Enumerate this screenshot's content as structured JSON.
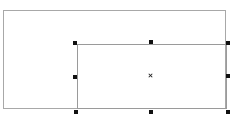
{
  "canvas": {
    "background": "#ffffff"
  },
  "shapes": [
    {
      "id": "outer-rectangle",
      "type": "rectangle",
      "x": 3,
      "y": 10,
      "width": 223,
      "height": 99,
      "stroke": "#a8a8a8",
      "selected": false
    },
    {
      "id": "inner-rectangle",
      "type": "rectangle",
      "x": 77,
      "y": 44,
      "width": 150,
      "height": 65,
      "stroke": "#9a9a9a",
      "selected": true
    }
  ],
  "selection": {
    "handle_color": "#111111",
    "handles": [
      {
        "name": "top-left",
        "x": 73,
        "y": 41
      },
      {
        "name": "top-center",
        "x": 149,
        "y": 40
      },
      {
        "name": "top-right",
        "x": 226,
        "y": 41
      },
      {
        "name": "middle-left",
        "x": 73,
        "y": 75
      },
      {
        "name": "middle-right",
        "x": 226,
        "y": 74
      },
      {
        "name": "bottom-left",
        "x": 74,
        "y": 110
      },
      {
        "name": "bottom-center",
        "x": 149,
        "y": 110
      },
      {
        "name": "bottom-right",
        "x": 226,
        "y": 110
      }
    ],
    "center": {
      "x": 148,
      "y": 73
    }
  }
}
